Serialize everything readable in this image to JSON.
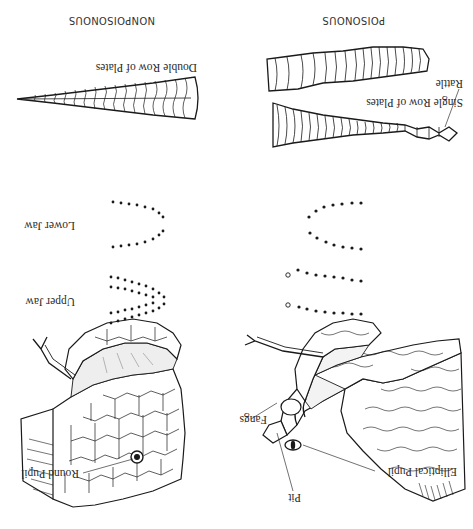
{
  "diagram": {
    "orientation": "rotated 180 degrees",
    "columns": [
      {
        "id": "poisonous",
        "title": "POISONOUS",
        "head_labels": {
          "pit": "Pit",
          "elliptical_pupil": "Elliptical Pupil",
          "fangs": "Fangs"
        },
        "jaw_dots": "two rows of fangs-side dots with open circles (fangs) on upper jaw",
        "tail_labels": {
          "rattle": "Rattle",
          "plates": "Single Row of Plates"
        }
      },
      {
        "id": "nonpoisonous",
        "title": "NONPOISONOUS",
        "head_labels": {
          "round_pupil": "Round Pupil"
        },
        "jaw_labels": {
          "upper": "Upper Jaw",
          "lower": "Lower Jaw"
        },
        "tail_labels": {
          "plates": "Double Row of Plates"
        }
      }
    ],
    "colors": {
      "ink": "#1a1a1a",
      "background": "#ffffff"
    }
  }
}
